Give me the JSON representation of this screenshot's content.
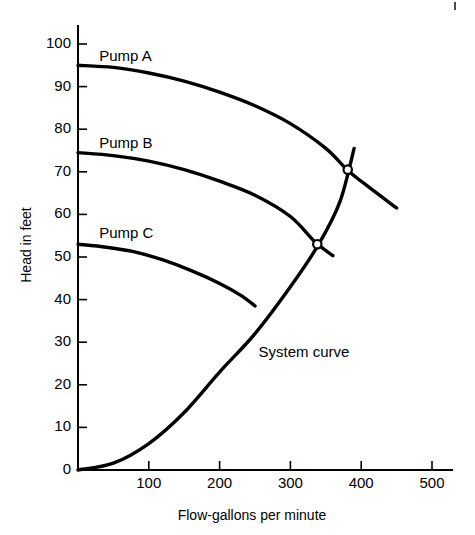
{
  "chart_data": {
    "type": "line",
    "title": "",
    "xlabel": "Flow-gallons per minute",
    "ylabel": "Head in feet",
    "xlim": [
      0,
      540
    ],
    "ylim": [
      0,
      105
    ],
    "grid": false,
    "legend_position": "inline-labels",
    "x_ticks": [
      100,
      200,
      300,
      400,
      500
    ],
    "x_tick_labels": [
      "100",
      "200",
      "300",
      "400",
      "500"
    ],
    "y_ticks": [
      0,
      10,
      20,
      30,
      40,
      50,
      60,
      70,
      80,
      90,
      100
    ],
    "y_tick_labels": [
      "0",
      "10",
      "20",
      "30",
      "40",
      "50",
      "60",
      "70",
      "80",
      "90",
      "100"
    ],
    "series": [
      {
        "name": "Pump A",
        "label": "Pump A",
        "label_x": 30,
        "label_y": 97,
        "points": [
          {
            "x": 0,
            "y": 95
          },
          {
            "x": 50,
            "y": 94.5
          },
          {
            "x": 100,
            "y": 93.2
          },
          {
            "x": 150,
            "y": 91.3
          },
          {
            "x": 200,
            "y": 88.7
          },
          {
            "x": 250,
            "y": 85.5
          },
          {
            "x": 300,
            "y": 81.3
          },
          {
            "x": 350,
            "y": 75.5
          },
          {
            "x": 380,
            "y": 70.5
          },
          {
            "x": 410,
            "y": 66.5
          },
          {
            "x": 450,
            "y": 61.5
          }
        ]
      },
      {
        "name": "Pump B",
        "label": "Pump B",
        "label_x": 30,
        "label_y": 76.5,
        "points": [
          {
            "x": 0,
            "y": 74.5
          },
          {
            "x": 50,
            "y": 73.8
          },
          {
            "x": 100,
            "y": 72.5
          },
          {
            "x": 150,
            "y": 70.5
          },
          {
            "x": 200,
            "y": 67.8
          },
          {
            "x": 250,
            "y": 64.5
          },
          {
            "x": 300,
            "y": 59.5
          },
          {
            "x": 335,
            "y": 53.5
          },
          {
            "x": 360,
            "y": 50.3
          }
        ]
      },
      {
        "name": "Pump C",
        "label": "Pump C",
        "label_x": 30,
        "label_y": 55.5,
        "points": [
          {
            "x": 0,
            "y": 53
          },
          {
            "x": 40,
            "y": 52.3
          },
          {
            "x": 80,
            "y": 51.2
          },
          {
            "x": 120,
            "y": 49.3
          },
          {
            "x": 160,
            "y": 46.8
          },
          {
            "x": 200,
            "y": 43.8
          },
          {
            "x": 230,
            "y": 41
          },
          {
            "x": 250,
            "y": 38.5
          }
        ]
      },
      {
        "name": "System curve",
        "label": "System curve",
        "label_x": 255,
        "label_y": 27.5,
        "points": [
          {
            "x": 0,
            "y": 0
          },
          {
            "x": 50,
            "y": 1.6
          },
          {
            "x": 100,
            "y": 6.2
          },
          {
            "x": 150,
            "y": 13.5
          },
          {
            "x": 200,
            "y": 23
          },
          {
            "x": 250,
            "y": 32
          },
          {
            "x": 300,
            "y": 43
          },
          {
            "x": 340,
            "y": 53
          },
          {
            "x": 370,
            "y": 63
          },
          {
            "x": 390,
            "y": 75.5
          }
        ]
      }
    ],
    "operating_points": [
      {
        "label": "Pump A / System intersection",
        "x": 381,
        "y": 70.5
      },
      {
        "label": "Pump B / System intersection",
        "x": 338,
        "y": 53
      }
    ]
  },
  "axes": {
    "x_title": "Flow-gallons per minute",
    "y_title": "Head in feet"
  },
  "colors": {
    "line": "#000000",
    "background": "#ffffff",
    "marker_fill": "#ffffff"
  }
}
